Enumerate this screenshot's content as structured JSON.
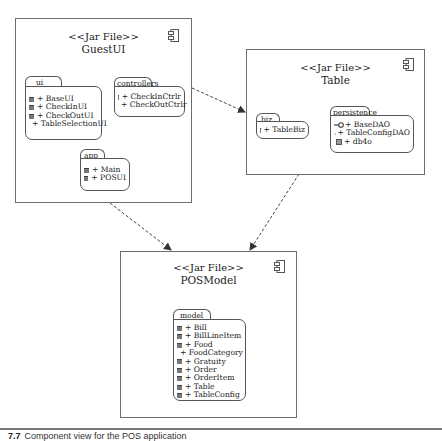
{
  "diagram": {
    "type": "uml-component-diagram",
    "components": [
      {
        "id": "guestui",
        "stereotype": "<<Jar File>>",
        "name": "GuestUI",
        "icon": "component-icon",
        "packages": [
          {
            "name": "ui",
            "items": [
              {
                "icon": "class-icon",
                "label": "+ BaseUI"
              },
              {
                "icon": "class-icon",
                "label": "+ CheckInUI"
              },
              {
                "icon": "class-icon",
                "label": "+ CheckOutUI"
              },
              {
                "icon": "class-icon",
                "label": "+ TableSelectionUI"
              }
            ]
          },
          {
            "name": "controllers",
            "items": [
              {
                "icon": "class-icon",
                "label": "+ CheckInCtrlr"
              },
              {
                "icon": "class-icon",
                "label": "+ CheckOutCtrlr"
              }
            ]
          },
          {
            "name": "app",
            "items": [
              {
                "icon": "class-icon",
                "label": "+ Main"
              },
              {
                "icon": "class-icon",
                "label": "+ POSUI"
              }
            ]
          }
        ]
      },
      {
        "id": "table",
        "stereotype": "<<Jar File>>",
        "name": "Table",
        "icon": "component-icon",
        "packages": [
          {
            "name": "biz",
            "items": [
              {
                "icon": "class-icon",
                "label": "+ TableBiz"
              }
            ]
          },
          {
            "name": "persistence",
            "items": [
              {
                "icon": "interface-icon",
                "label": "+ BaseDAO"
              },
              {
                "icon": "interface-icon",
                "label": "+ TableConfigDAO"
              },
              {
                "icon": "package-icon",
                "label": "+ db4o"
              }
            ]
          }
        ]
      },
      {
        "id": "posmodel",
        "stereotype": "<<Jar File>>",
        "name": "POSModel",
        "icon": "component-icon",
        "packages": [
          {
            "name": "model",
            "items": [
              {
                "icon": "class-icon",
                "label": "+ Bill"
              },
              {
                "icon": "class-icon",
                "label": "+ BillLineItem"
              },
              {
                "icon": "class-icon",
                "label": "+ Food"
              },
              {
                "icon": "class-icon",
                "label": "+ FoodCategory"
              },
              {
                "icon": "class-icon",
                "label": "+ Gratuity"
              },
              {
                "icon": "class-icon",
                "label": "+ Order"
              },
              {
                "icon": "class-icon",
                "label": "+ OrderItem"
              },
              {
                "icon": "class-icon",
                "label": "+ Table"
              },
              {
                "icon": "class-icon",
                "label": "+ TableConfig"
              }
            ]
          }
        ]
      }
    ],
    "dependencies": [
      {
        "from": "GuestUI",
        "to": "Table",
        "style": "dashed-arrow"
      },
      {
        "from": "GuestUI",
        "to": "POSModel",
        "style": "dashed-arrow"
      },
      {
        "from": "Table",
        "to": "POSModel",
        "style": "dashed-arrow"
      }
    ],
    "caption": {
      "number": "7.7",
      "text": "Component view for the POS application"
    },
    "colors": {
      "border": "#6e6e6e",
      "line": "#444444",
      "background": "#ffffff"
    }
  }
}
